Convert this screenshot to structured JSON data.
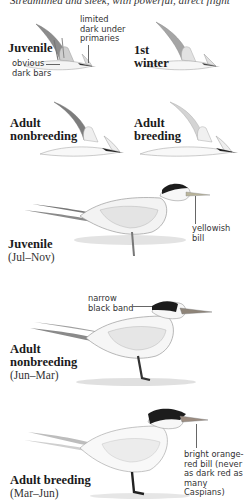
{
  "page": {
    "caption_top": "Streamlined and sleek, with powerful, direct flight"
  },
  "flight_figures": [
    {
      "label": "Juvenile",
      "notes": [
        "limited dark under primaries",
        "obvious dark bars"
      ]
    },
    {
      "label": "1st winter"
    },
    {
      "label": "Adult nonbreeding"
    },
    {
      "label": "Adult breeding"
    }
  ],
  "standing_figures": [
    {
      "label": "Juvenile",
      "season": "(Jul–Nov)",
      "note": "yellowish bill"
    },
    {
      "label": "Adult nonbreeding",
      "season": "(Jun–Mar)",
      "note": "narrow black band"
    },
    {
      "label": "Adult breeding",
      "season": "(Mar–Jun)",
      "note": "bright orange-red bill (never as dark red as many Caspians)"
    }
  ],
  "labels": {
    "juv_flight_l1": "Juvenile",
    "juv_flight_note_primaries_l1": "limited",
    "juv_flight_note_primaries_l2": "dark under",
    "juv_flight_note_primaries_l3": "primaries",
    "juv_flight_note_bars_l1": "obvious",
    "juv_flight_note_bars_l2": "dark bars",
    "first_winter_l1": "1st",
    "first_winter_l2": "winter",
    "adult_nb_flight_l1": "Adult",
    "adult_nb_flight_l2": "nonbreeding",
    "adult_br_flight_l1": "Adult",
    "adult_br_flight_l2": "breeding",
    "juv_stand_l1": "Juvenile",
    "juv_stand_season": "(Jul–Nov)",
    "juv_stand_note_l1": "yellowish",
    "juv_stand_note_l2": "bill",
    "nb_stand_note_l1": "narrow",
    "nb_stand_note_l2": "black band",
    "nb_stand_l1": "Adult",
    "nb_stand_l2": "nonbreeding",
    "nb_stand_season": "(Jun–Mar)",
    "br_stand_note_l1": "bright orange-",
    "br_stand_note_l2": "red bill (never",
    "br_stand_note_l3": "as dark red as",
    "br_stand_note_l4": "many Caspians)",
    "br_stand_l1": "Adult breeding",
    "br_stand_season": "(Mar–Jun)"
  },
  "colors": {
    "cap_black": "#1c1c1c",
    "wing_gray": "#8a8a8a",
    "body_white": "#f7f7f7",
    "outline": "#9a9a9a",
    "bill_yellowish": "#b9b49a",
    "bill_orange": "#9c8c80"
  }
}
